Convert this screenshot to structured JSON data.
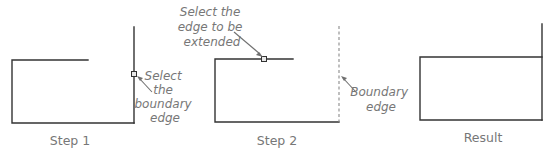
{
  "diagram": {
    "panels": [
      {
        "id": "step1",
        "caption": "Step 1"
      },
      {
        "id": "step2",
        "caption": "Step 2"
      },
      {
        "id": "result",
        "caption": "Result"
      }
    ],
    "callouts": {
      "select_boundary": [
        "Select",
        "the",
        "boundary",
        "edge"
      ],
      "select_edge": [
        "Select the",
        "edge to be",
        "extended"
      ],
      "boundary_edge": [
        "Boundary",
        "edge"
      ]
    },
    "colors": {
      "line": "#333333",
      "annotation_text": "#777777",
      "arrow": "#707070",
      "dashed_boundary": "#8a8a8a"
    }
  }
}
